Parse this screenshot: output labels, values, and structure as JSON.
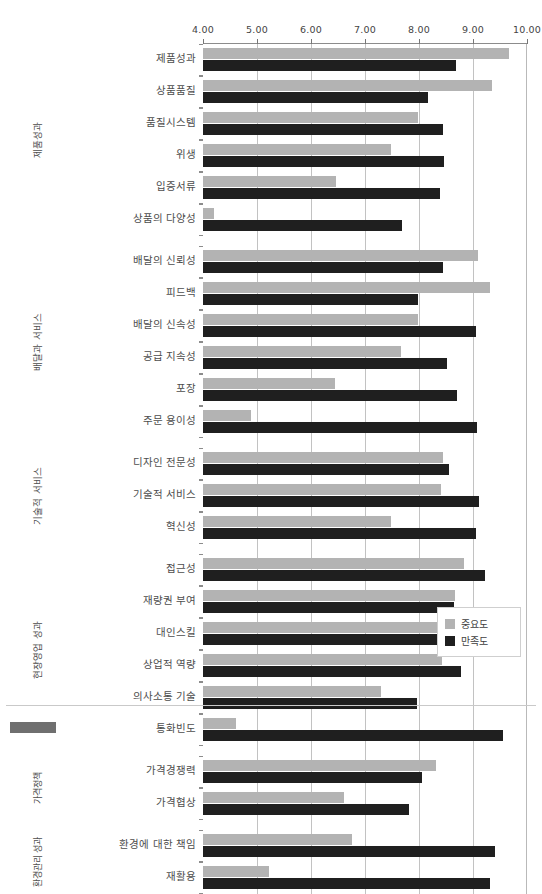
{
  "chart_data": {
    "type": "bar",
    "orientation": "horizontal",
    "title": "",
    "xlabel": "",
    "ylabel": "",
    "xlim": [
      4.0,
      10.0
    ],
    "xticks": [
      "4.00",
      "5.00",
      "6.00",
      "7.00",
      "8.00",
      "9.00",
      "10.00"
    ],
    "xtick_values": [
      4,
      5,
      6,
      7,
      8,
      9,
      10
    ],
    "grid": true,
    "legend_position": "bottom-right",
    "series": [
      {
        "name": "중요도",
        "color": "#b3b3b3"
      },
      {
        "name": "만족도",
        "color": "#1f1f1f"
      }
    ],
    "groups": [
      {
        "label": "제품성과",
        "categories": [
          {
            "label": "제품성과",
            "중요도": 9.66,
            "만족도": 8.68
          },
          {
            "label": "상품품질",
            "중요도": 9.35,
            "만족도": 8.16
          },
          {
            "label": "품질시스템",
            "중요도": 7.98,
            "만족도": 8.44
          },
          {
            "label": "위생",
            "중요도": 7.48,
            "만족도": 8.46
          },
          {
            "label": "입증서류",
            "중요도": 6.46,
            "만족도": 8.38
          },
          {
            "label": "상품의 다양성",
            "중요도": 4.2,
            "만족도": 7.68
          }
        ]
      },
      {
        "label": "배달과 서비스",
        "categories": [
          {
            "label": "배달의 신뢰성",
            "중요도": 9.1,
            "만족도": 8.44
          },
          {
            "label": "피드백",
            "중요도": 9.32,
            "만족도": 7.98
          },
          {
            "label": "배달의 신속성",
            "중요도": 7.98,
            "만족도": 9.06
          },
          {
            "label": "공급 지속성",
            "중요도": 7.66,
            "만족도": 8.52
          },
          {
            "label": "포장",
            "중요도": 6.44,
            "만족도": 8.7
          },
          {
            "label": "주문 용이성",
            "중요도": 4.88,
            "만족도": 9.08
          }
        ]
      },
      {
        "label": "기술적 서비스",
        "categories": [
          {
            "label": "디자인 전문성",
            "중요도": 8.44,
            "만족도": 8.56
          },
          {
            "label": "기술적 서비스",
            "중요도": 8.4,
            "만족도": 9.12
          },
          {
            "label": "혁신성",
            "중요도": 7.48,
            "만족도": 9.06
          }
        ]
      },
      {
        "label": "현장영업 성과",
        "categories": [
          {
            "label": "접근성",
            "중요도": 8.84,
            "만족도": 9.22
          },
          {
            "label": "재량권 부여",
            "중요도": 8.66,
            "만족도": 8.64
          },
          {
            "label": "대인스킬",
            "중요도": 8.48,
            "만족도": 9.64
          },
          {
            "label": "상업적 역량",
            "중요도": 8.42,
            "만족도": 8.78
          },
          {
            "label": "의사소통 기술",
            "중요도": 7.3,
            "만족도": 7.96
          },
          {
            "label": "통화빈도",
            "중요도": 4.62,
            "만족도": 9.56
          }
        ]
      },
      {
        "label": "가격정책",
        "categories": [
          {
            "label": "가격경쟁력",
            "중요도": 8.32,
            "만족도": 8.06
          },
          {
            "label": "가격협상",
            "중요도": 6.62,
            "만족도": 7.82
          }
        ]
      },
      {
        "label": "환경관리 성과",
        "categories": [
          {
            "label": "환경에 대한 책임",
            "중요도": 6.76,
            "만족도": 9.4
          },
          {
            "label": "재활용",
            "중요도": 5.22,
            "만족도": 9.32
          }
        ]
      }
    ]
  }
}
